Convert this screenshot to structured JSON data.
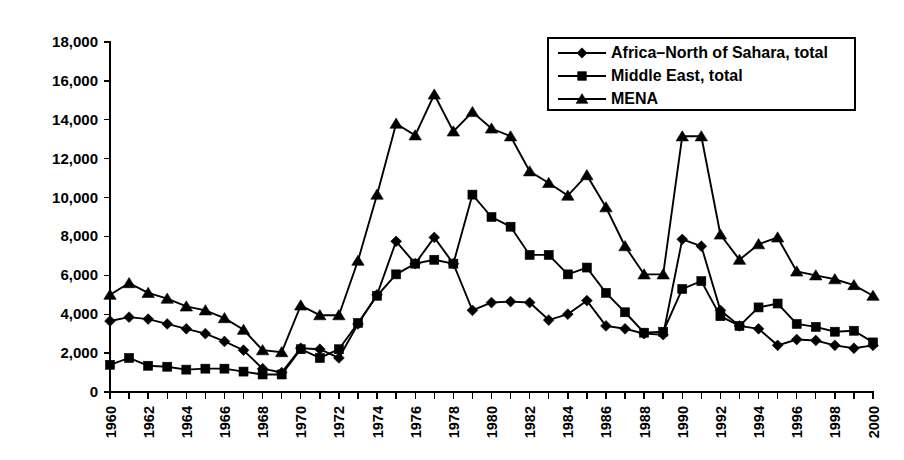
{
  "chart_data": {
    "type": "line",
    "title": "",
    "subtitle": "",
    "xlabel": "",
    "ylabel": "",
    "xlim": [
      1960,
      2000
    ],
    "ylim": [
      0,
      18000
    ],
    "ytick_values": [
      0,
      2000,
      4000,
      6000,
      8000,
      10000,
      12000,
      14000,
      16000,
      18000
    ],
    "ytick_labels": [
      "0",
      "2,000",
      "4,000",
      "6,000",
      "8,000",
      "10,000",
      "12,000",
      "14,000",
      "16,000",
      "18,000"
    ],
    "xtick_labels": [
      "1960",
      "1962",
      "1964",
      "1966",
      "1968",
      "1970",
      "1972",
      "1974",
      "1976",
      "1978",
      "1980",
      "1982",
      "1984",
      "1986",
      "1988",
      "1990",
      "1992",
      "1994",
      "1996",
      "1998",
      "2000"
    ],
    "xtick_label_rotation": -90,
    "x": [
      1960,
      1961,
      1962,
      1963,
      1964,
      1965,
      1966,
      1967,
      1968,
      1969,
      1970,
      1971,
      1972,
      1973,
      1974,
      1975,
      1976,
      1977,
      1978,
      1979,
      1980,
      1981,
      1982,
      1983,
      1984,
      1985,
      1986,
      1987,
      1988,
      1989,
      1990,
      1991,
      1992,
      1993,
      1994,
      1995,
      1996,
      1997,
      1998,
      1999,
      2000
    ],
    "grid": false,
    "legend_position": "top-right",
    "series": [
      {
        "name": "Africa–North of Sahara, total",
        "marker": "diamond",
        "color": "#000000",
        "values": [
          3650,
          3850,
          3750,
          3500,
          3250,
          3000,
          2600,
          2150,
          1200,
          1000,
          2250,
          2200,
          1750,
          3500,
          5000,
          7750,
          6600,
          7950,
          6600,
          4200,
          4600,
          4650,
          4600,
          3700,
          4000,
          4700,
          3400,
          3250,
          3000,
          2950,
          7850,
          7500,
          4200,
          3400,
          3250,
          2400,
          2700,
          2650,
          2400,
          2250,
          2400
        ]
      },
      {
        "name": "Middle East, total",
        "marker": "square",
        "color": "#000000",
        "values": [
          1400,
          1750,
          1350,
          1300,
          1150,
          1200,
          1200,
          1050,
          900,
          900,
          2200,
          1750,
          2200,
          3550,
          4950,
          6050,
          6600,
          6800,
          6600,
          10150,
          9000,
          8500,
          7050,
          7050,
          6050,
          6400,
          5100,
          4100,
          3050,
          3100,
          5300,
          5700,
          3900,
          3400,
          4350,
          4550,
          3500,
          3350,
          3100,
          3150,
          2550
        ]
      },
      {
        "name": "MENA",
        "marker": "triangle",
        "color": "#000000",
        "values": [
          5000,
          5600,
          5100,
          4800,
          4400,
          4200,
          3800,
          3200,
          2150,
          2050,
          4450,
          3950,
          3950,
          6750,
          10150,
          13800,
          13200,
          15300,
          13400,
          14400,
          13550,
          13150,
          11350,
          10750,
          10100,
          11150,
          9500,
          7500,
          6050,
          6050,
          13150,
          13150,
          8100,
          6800,
          7600,
          7950,
          6200,
          6000,
          5800,
          5500,
          4950
        ]
      }
    ]
  },
  "legend": {
    "items": [
      {
        "label": "Africa–North of Sahara, total",
        "marker": "diamond"
      },
      {
        "label": "Middle East, total",
        "marker": "square"
      },
      {
        "label": "MENA",
        "marker": "triangle"
      }
    ]
  }
}
